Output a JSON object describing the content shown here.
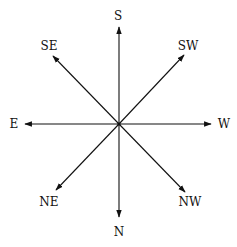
{
  "diagram": {
    "center": [
      119,
      124
    ],
    "line_color": "#111111",
    "directions": [
      {
        "label": "S",
        "tip": [
          119,
          27
        ],
        "text_pos": [
          118,
          20
        ]
      },
      {
        "label": "SW",
        "tip": [
          184,
          55
        ],
        "text_pos": [
          188,
          50
        ]
      },
      {
        "label": "W",
        "tip": [
          211,
          124
        ],
        "text_pos": [
          224,
          128
        ]
      },
      {
        "label": "NW",
        "tip": [
          185,
          192
        ],
        "text_pos": [
          190,
          206
        ]
      },
      {
        "label": "N",
        "tip": [
          119,
          217
        ],
        "text_pos": [
          119,
          236
        ]
      },
      {
        "label": "NE",
        "tip": [
          56,
          190
        ],
        "text_pos": [
          49,
          206
        ]
      },
      {
        "label": "E",
        "tip": [
          25,
          124
        ],
        "text_pos": [
          14,
          128
        ]
      },
      {
        "label": "SE",
        "tip": [
          53,
          56
        ],
        "text_pos": [
          49,
          50
        ]
      }
    ]
  }
}
